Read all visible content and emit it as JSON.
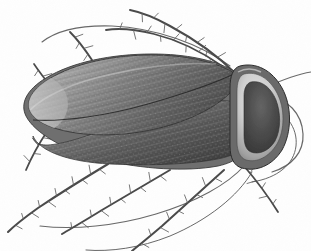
{
  "figure": {
    "subject": "cockroach",
    "view": "dorsal",
    "orientation": "head-right",
    "medium": "grayscale-engraving",
    "caption": "",
    "width_px": 311,
    "height_px": 251
  },
  "palette": {
    "background": "#fefefe",
    "paper_tint": "#fbfbfb",
    "outline": "#3a3a3a",
    "body_light": "#b8b8b8",
    "body_mid": "#8a8a8a",
    "body_dark": "#5a5a5a",
    "body_darkest": "#3c3c3c",
    "pronotum_rim": "#d6d6d6",
    "pronotum_blotch": "#474747",
    "leg_stroke": "#4a4a4a",
    "antenna_stroke": "#585858",
    "seta_stroke": "#5f5f5f",
    "highlight": "#e8e8e8"
  },
  "anatomy": {
    "parts": [
      {
        "id": "pronotum",
        "label": "Pronotum",
        "note": "rounded triangular shield, pale rim, dark central blotch"
      },
      {
        "id": "left_tegmen",
        "label": "Left forewing (tegmen)",
        "note": "upper overlapping wing, fine longitudinal veins"
      },
      {
        "id": "right_tegmen",
        "label": "Right forewing (tegmen)",
        "note": "lower wing, stippled membrane"
      },
      {
        "id": "abdomen_tip",
        "label": "Abdomen tip",
        "note": "rounded left end of wing case"
      },
      {
        "id": "antennae",
        "label": "Antennae",
        "note": "two long filiform antennae sweeping right and up-left"
      },
      {
        "id": "legs",
        "label": "Legs",
        "note": "six spinose legs bearing stout setae"
      }
    ]
  },
  "body": {
    "outline_path": "M 232 70 C 214 60 186 54 152 54 C 112 54 72 62 46 78 C 26 90 20 104 26 116 C 34 132 62 150 104 160 C 142 169 186 172 218 166 C 236 162 246 154 246 142 L 246 88 C 246 78 240 73 232 70 Z",
    "upper_wing_path": "M 231 71 C 212 61 184 55 152 55 C 114 55 75 63 49 79 C 30 91 25 103 31 113 C 40 128 78 138 124 134 C 170 130 212 112 231 92 C 238 84 238 75 231 71 Z",
    "lower_wing_path": "M 244 104 C 226 98 196 100 162 110 C 122 122 82 140 56 144 C 40 147 33 143 33 136 C 40 152 70 162 110 164 C 152 166 196 164 222 158 C 238 154 246 148 246 140 L 246 110 Z",
    "wing_seam_path": "M 33 120 C 62 122 106 116 148 104 C 190 92 222 80 238 72",
    "abdomen_sheen_path": "M 30 110 C 44 96 74 82 112 74 C 148 66 186 62 216 64",
    "vein_count": 26,
    "stipple_rows": 16
  },
  "pronotum": {
    "shield_path": "M 240 66 C 256 62 272 70 282 88 C 292 106 292 132 282 150 C 272 166 256 172 242 168 C 234 166 230 158 230 146 L 230 88 C 230 76 233 68 240 66 Z",
    "rim_path": "M 244 74 C 257 71 269 78 277 93 C 285 108 285 130 277 144 C 269 157 257 163 246 160 C 240 158 237 151 237 142 L 237 92 C 237 82 239 76 244 74 Z",
    "blotch_path": "M 251 82 C 262 80 271 88 276 100 C 281 113 281 130 275 141 C 269 151 259 155 251 152 C 246 150 244 144 244 135 L 244 96 C 244 88 247 83 251 82 Z",
    "highlight_path": "M 238 72 C 245 68 253 68 261 72"
  },
  "antennae": [
    {
      "id": "antenna-right-upper",
      "path": "M 264 88 C 282 80 298 74 311 72",
      "width": 1.1
    },
    {
      "id": "antenna-right-sweep",
      "path": "M 266 96 C 288 98 302 114 303 134 C 304 152 292 166 272 172",
      "width": 1.2
    },
    {
      "id": "antenna-right-long",
      "path": "M 262 104 C 286 110 298 128 296 146 C 294 164 278 178 252 182",
      "width": 1.0
    },
    {
      "id": "antenna-left-arc",
      "path": "M 230 66 C 200 44 156 28 112 26 C 80 25 56 31 42 42",
      "width": 1.1
    },
    {
      "id": "antenna-lower-arc",
      "path": "M 244 166 C 228 184 196 202 156 214 C 116 226 74 230 40 226",
      "width": 1.1
    },
    {
      "id": "antenna-lower-long",
      "path": "M 252 172 C 238 196 208 220 170 236 C 140 248 110 252 86 250",
      "width": 1.0
    }
  ],
  "legs": [
    {
      "id": "leg-front-right",
      "path": "M 236 74 C 220 58 196 40 170 26 C 154 17 140 12 130 10",
      "width": 2.0,
      "setae": 9
    },
    {
      "id": "leg-mid-right-upper",
      "path": "M 222 66 C 202 52 178 40 154 34 C 134 29 118 28 106 30",
      "width": 1.8,
      "setae": 8
    },
    {
      "id": "leg-front-left",
      "path": "M 92 60 C 84 48 76 38 70 32",
      "width": 1.9,
      "setae": 4
    },
    {
      "id": "leg-mid-left",
      "path": "M 52 88 C 44 78 38 70 34 64",
      "width": 1.7,
      "setae": 3
    },
    {
      "id": "leg-hind-left",
      "path": "M 48 130 C 40 142 32 156 26 170",
      "width": 1.8,
      "setae": 4
    },
    {
      "id": "leg-hind-lower-left",
      "path": "M 108 164 C 88 176 62 192 38 208 C 24 218 14 226 8 232",
      "width": 2.1,
      "setae": 11
    },
    {
      "id": "leg-mid-lower",
      "path": "M 170 170 C 150 182 126 196 102 210 C 86 220 72 228 62 234",
      "width": 2.0,
      "setae": 10
    },
    {
      "id": "leg-hind-right-lower",
      "path": "M 224 170 C 206 186 184 206 162 226 C 148 238 138 246 132 251",
      "width": 2.0,
      "setae": 9
    },
    {
      "id": "leg-rear-right",
      "path": "M 244 166 C 256 180 268 196 278 212",
      "width": 1.8,
      "setae": 5
    }
  ],
  "accessibility": {
    "alt_text": "Grayscale dorsal illustration of a cockroach with head to the right, oval veined wing case, triangular pronotum shield, six spiny legs and two long antennae."
  }
}
